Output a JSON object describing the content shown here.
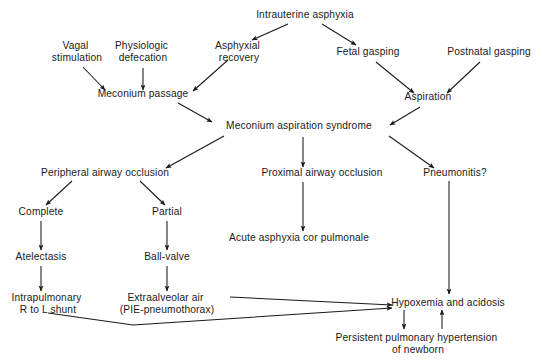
{
  "diagram": {
    "colors": {
      "ink": "#1a1a1a",
      "background": "#ffffff"
    },
    "nodes": [
      {
        "id": "intrauterine_asphyxia",
        "lines": [
          "Intrauterine asphyxia"
        ],
        "x": 305,
        "y": 18
      },
      {
        "id": "vagal_stimulation",
        "lines": [
          "Vagal",
          "stimulation"
        ],
        "x": 77,
        "y": 49
      },
      {
        "id": "physiologic_defecation",
        "lines": [
          "Physiologic",
          "defecation"
        ],
        "x": 143,
        "y": 49
      },
      {
        "id": "asphyxial_recovery",
        "lines": [
          "Asphyxial",
          "recovery"
        ],
        "x": 239,
        "y": 49
      },
      {
        "id": "fetal_gasping",
        "lines": [
          "Fetal gasping"
        ],
        "x": 368,
        "y": 55
      },
      {
        "id": "postnatal_gasping",
        "lines": [
          "Postnatal gasping"
        ],
        "x": 489,
        "y": 55
      },
      {
        "id": "meconium_passage",
        "lines": [
          "Meconium passage"
        ],
        "x": 143,
        "y": 97
      },
      {
        "id": "aspiration",
        "lines": [
          "Aspiration"
        ],
        "x": 428,
        "y": 100
      },
      {
        "id": "meconium_aspiration_syndrome",
        "lines": [
          "Meconium aspiration syndrome"
        ],
        "x": 299,
        "y": 129
      },
      {
        "id": "peripheral_airway_occlusion",
        "lines": [
          "Peripheral airway occlusion"
        ],
        "x": 105,
        "y": 174
      },
      {
        "id": "proximal_airway_occlusion",
        "lines": [
          "Proximal airway occlusion"
        ],
        "x": 322,
        "y": 174
      },
      {
        "id": "pneumonitis",
        "lines": [
          "Pneumonitis?"
        ],
        "x": 455,
        "y": 174
      },
      {
        "id": "complete",
        "lines": [
          "Complete"
        ],
        "x": 41,
        "y": 213
      },
      {
        "id": "partial",
        "lines": [
          "Partial"
        ],
        "x": 167,
        "y": 213
      },
      {
        "id": "atelectasis",
        "lines": [
          "Atelectasis"
        ],
        "x": 41,
        "y": 258
      },
      {
        "id": "ball_valve",
        "lines": [
          "Ball-valve"
        ],
        "x": 167,
        "y": 258
      },
      {
        "id": "acute_asphyxia_cor_pulmonale",
        "lines": [
          "Acute asphyxia cor pulmonale"
        ],
        "x": 299,
        "y": 239
      },
      {
        "id": "intrapulmonary_shunt",
        "lines": [
          "Intrapulmonary",
          "R to L shunt"
        ],
        "x": 48,
        "y": 299
      },
      {
        "id": "extraalveolar_air",
        "lines": [
          "Extraalveolar air",
          "(PIE-pneumothorax)"
        ],
        "x": 167,
        "y": 299
      },
      {
        "id": "hypoxemia_and_acidosis",
        "lines": [
          "Hypoxemia and acidosis"
        ],
        "x": 448,
        "y": 304
      },
      {
        "id": "persistent_pulmonary_hypertension",
        "lines": [
          "Persistent pulmonary hypertension",
          "of newborn"
        ],
        "x": 418,
        "y": 339
      }
    ],
    "edges": [
      {
        "id": "intrauterine-to-asphyxial",
        "from": "intrauterine_asphyxia",
        "to": "asphyxial_recovery",
        "arrow": true
      },
      {
        "id": "intrauterine-to-fetal-gasping",
        "from": "intrauterine_asphyxia",
        "to": "fetal_gasping",
        "arrow": true
      },
      {
        "id": "vagal-to-meconium-passage",
        "from": "vagal_stimulation",
        "to": "meconium_passage",
        "arrow": true
      },
      {
        "id": "physiologic-to-meconium-passage",
        "from": "physiologic_defecation",
        "to": "meconium_passage",
        "arrow": true
      },
      {
        "id": "asphyxial-to-meconium-passage",
        "from": "asphyxial_recovery",
        "to": "meconium_passage",
        "arrow": true
      },
      {
        "id": "fetal-gasping-to-aspiration",
        "from": "fetal_gasping",
        "to": "aspiration",
        "arrow": true
      },
      {
        "id": "postnatal-gasping-to-aspiration",
        "from": "postnatal_gasping",
        "to": "aspiration",
        "arrow": true
      },
      {
        "id": "meconium-passage-to-mas",
        "from": "meconium_passage",
        "to": "meconium_aspiration_syndrome",
        "arrow": true
      },
      {
        "id": "aspiration-to-mas",
        "from": "aspiration",
        "to": "meconium_aspiration_syndrome",
        "arrow": true
      },
      {
        "id": "mas-to-peripheral",
        "from": "meconium_aspiration_syndrome",
        "to": "peripheral_airway_occlusion",
        "arrow": true
      },
      {
        "id": "mas-to-proximal",
        "from": "meconium_aspiration_syndrome",
        "to": "proximal_airway_occlusion",
        "arrow": true
      },
      {
        "id": "mas-to-pneumonitis",
        "from": "meconium_aspiration_syndrome",
        "to": "pneumonitis",
        "arrow": true
      },
      {
        "id": "peripheral-to-complete",
        "from": "peripheral_airway_occlusion",
        "to": "complete",
        "arrow": true
      },
      {
        "id": "peripheral-to-partial",
        "from": "peripheral_airway_occlusion",
        "to": "partial",
        "arrow": true
      },
      {
        "id": "complete-to-atelectasis",
        "from": "complete",
        "to": "atelectasis",
        "arrow": true
      },
      {
        "id": "partial-to-ball-valve",
        "from": "partial",
        "to": "ball_valve",
        "arrow": true
      },
      {
        "id": "proximal-to-acute-asphyxia",
        "from": "proximal_airway_occlusion",
        "to": "acute_asphyxia_cor_pulmonale",
        "arrow": true
      },
      {
        "id": "atelectasis-to-intrapulmonary",
        "from": "atelectasis",
        "to": "intrapulmonary_shunt",
        "arrow": true
      },
      {
        "id": "ball-valve-to-extraalveolar",
        "from": "ball_valve",
        "to": "extraalveolar_air",
        "arrow": true
      },
      {
        "id": "pneumonitis-to-hypoxemia",
        "from": "pneumonitis",
        "to": "hypoxemia_and_acidosis",
        "arrow": true
      },
      {
        "id": "extraalveolar-to-hypoxemia",
        "from": "extraalveolar_air",
        "to": "hypoxemia_and_acidosis",
        "arrow": true
      },
      {
        "id": "intrapulmonary-to-hypoxemia",
        "from": "intrapulmonary_shunt",
        "to": "hypoxemia_and_acidosis",
        "arrow": true
      },
      {
        "id": "hypoxemia-to-pphn",
        "from": "hypoxemia_and_acidosis",
        "to": "persistent_pulmonary_hypertension",
        "arrow": true
      },
      {
        "id": "pphn-to-hypoxemia",
        "from": "persistent_pulmonary_hypertension",
        "to": "hypoxemia_and_acidosis",
        "arrow": true
      }
    ]
  }
}
